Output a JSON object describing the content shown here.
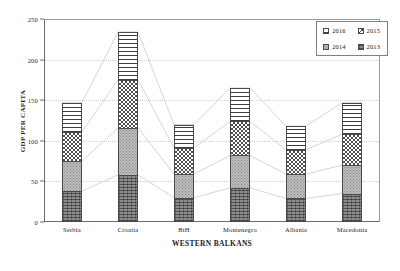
{
  "chart_data": {
    "type": "bar",
    "stacked": true,
    "title": "",
    "xlabel": "WESTERN BALKANS",
    "ylabel": "GDP PER CAPITA",
    "ylim": [
      0,
      250
    ],
    "yticks": [
      0,
      50,
      100,
      150,
      200,
      250
    ],
    "grid": true,
    "legend_position": "top-right",
    "categories": [
      "Serbia",
      "Croatia",
      "BiH",
      "Montenegro",
      "Albania",
      "Macedonia"
    ],
    "series": [
      {
        "name": "2013",
        "pattern": "dark-dense",
        "values": [
          38,
          58,
          30,
          42,
          29,
          35
        ]
      },
      {
        "name": "2014",
        "pattern": "light-speckle",
        "values": [
          37,
          58,
          29,
          40,
          30,
          35
        ]
      },
      {
        "name": "2015",
        "pattern": "checkerboard",
        "values": [
          36,
          59,
          32,
          42,
          30,
          38
        ]
      },
      {
        "name": "2016",
        "pattern": "horizontal-lines",
        "values": [
          36,
          59,
          29,
          41,
          29,
          39
        ]
      }
    ],
    "totals": [
      147,
      234,
      120,
      165,
      118,
      147
    ],
    "cumulative": {
      "Serbia": [
        38,
        75,
        111,
        147
      ],
      "Croatia": [
        58,
        116,
        175,
        234
      ],
      "BiH": [
        30,
        59,
        91,
        120
      ],
      "Montenegro": [
        42,
        82,
        124,
        165
      ],
      "Albania": [
        29,
        59,
        89,
        118
      ],
      "Macedonia": [
        35,
        70,
        108,
        147
      ]
    }
  },
  "legend": {
    "entries": [
      {
        "label": "2016",
        "pattern": "horizontal-lines"
      },
      {
        "label": "2015",
        "pattern": "checkerboard"
      },
      {
        "label": "2014",
        "pattern": "light-speckle"
      },
      {
        "label": "2013",
        "pattern": "dark-dense"
      }
    ]
  },
  "axes": {
    "y_title": "GDP PER CAPITA",
    "x_title": "WESTERN BALKANS",
    "y_tick_labels": [
      "0",
      "50",
      "100",
      "150",
      "200",
      "250"
    ],
    "x_tick_labels": [
      "Serbia",
      "Croatia",
      "BiH",
      "Montenegro",
      "Albania",
      "Macedonia"
    ]
  },
  "colors": {
    "axis": "#6b6b6b",
    "grid": "#cfcfcf",
    "connector": "#d0d0d0",
    "text": "#1a1a1a"
  }
}
